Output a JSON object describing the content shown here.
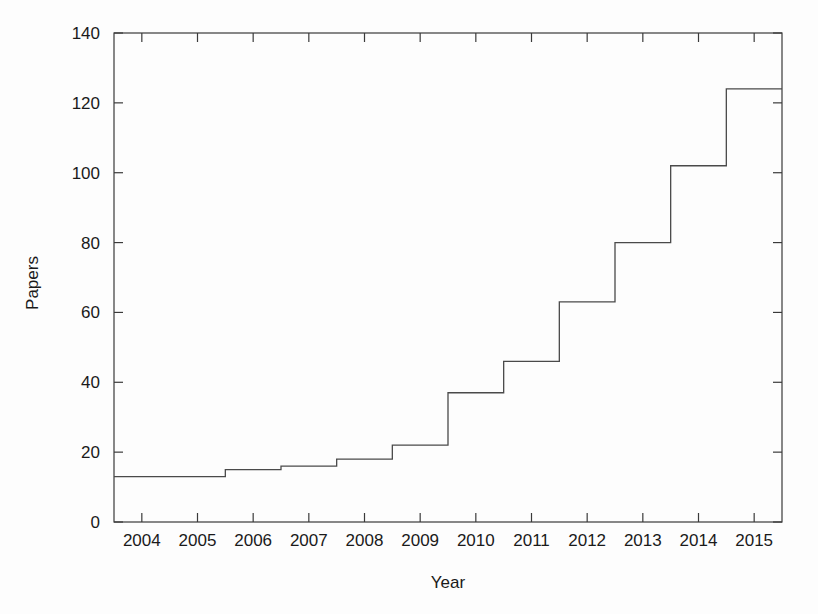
{
  "chart_data": {
    "type": "line",
    "subtype": "step-post",
    "title": "",
    "xlabel": "Year",
    "ylabel": "Papers",
    "categories": [
      2004,
      2005,
      2006,
      2007,
      2008,
      2009,
      2010,
      2011,
      2012,
      2013,
      2014,
      2015
    ],
    "values": [
      13,
      13,
      15,
      16,
      18,
      22,
      37,
      46,
      63,
      80,
      102,
      124
    ],
    "series": [
      {
        "name": "Papers",
        "values": [
          13,
          13,
          15,
          16,
          18,
          22,
          37,
          46,
          63,
          80,
          102,
          124
        ]
      }
    ],
    "xlim": [
      2003.5,
      2015.5
    ],
    "ylim": [
      0,
      140
    ],
    "x_ticks": [
      2004,
      2005,
      2006,
      2007,
      2008,
      2009,
      2010,
      2011,
      2012,
      2013,
      2014,
      2015
    ],
    "x_tick_labels": [
      "2004",
      "2005",
      "2006",
      "2007",
      "2008",
      "2009",
      "2010",
      "2011",
      "2012",
      "2013",
      "2014",
      "2015"
    ],
    "y_ticks": [
      0,
      20,
      40,
      60,
      80,
      100,
      120,
      140
    ],
    "y_tick_labels": [
      "0",
      "20",
      "40",
      "60",
      "80",
      "100",
      "120",
      "140"
    ],
    "grid": false,
    "legend": "none",
    "line_color": "#4a4a4a",
    "axis_color": "#3a3a3a",
    "background_color": "#fdfdfd",
    "step_boundaries_at_half_year": true
  },
  "plot_box": {
    "left": 114,
    "right": 782,
    "top": 33,
    "bottom": 522
  }
}
